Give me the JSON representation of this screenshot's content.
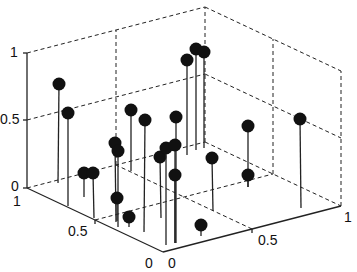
{
  "chart_data": {
    "type": "scatter",
    "subtype": "stem3",
    "title": "",
    "xlabel": "",
    "ylabel": "",
    "zlabel": "",
    "xlim": [
      0,
      1
    ],
    "ylim": [
      0,
      1
    ],
    "zlim": [
      0,
      1
    ],
    "x_ticks": [
      "0",
      "0.5",
      "1"
    ],
    "y_ticks": [
      "0",
      "0.5",
      "1"
    ],
    "z_ticks": [
      "0",
      "0.5",
      "1"
    ],
    "grid": true,
    "grid_style": "dashed",
    "marker": "filled-circle",
    "color": "#111111",
    "points_screen": [
      {
        "ball": [
          59,
          84
        ],
        "base": [
          58,
          183
        ]
      },
      {
        "ball": [
          68,
          113
        ],
        "base": [
          68,
          206
        ]
      },
      {
        "ball": [
          84,
          173
        ],
        "base": [
          84,
          197
        ]
      },
      {
        "ball": [
          93,
          173
        ],
        "base": [
          94,
          218
        ]
      },
      {
        "ball": [
          115,
          143
        ],
        "base": [
          116,
          222
        ]
      },
      {
        "ball": [
          118,
          151
        ],
        "base": [
          118,
          227
        ]
      },
      {
        "ball": [
          117,
          198
        ],
        "base": [
          117,
          221
        ]
      },
      {
        "ball": [
          129,
          217
        ],
        "base": [
          129,
          227
        ]
      },
      {
        "ball": [
          131,
          110
        ],
        "base": [
          131,
          171
        ]
      },
      {
        "ball": [
          145,
          120
        ],
        "base": [
          144,
          232
        ]
      },
      {
        "ball": [
          160,
          157
        ],
        "base": [
          161,
          218
        ]
      },
      {
        "ball": [
          166,
          148
        ],
        "base": [
          166,
          245
        ]
      },
      {
        "ball": [
          176,
          117
        ],
        "base": [
          176,
          243
        ]
      },
      {
        "ball": [
          175,
          145
        ],
        "base": [
          175,
          243
        ]
      },
      {
        "ball": [
          175,
          175
        ],
        "base": [
          175,
          243
        ]
      },
      {
        "ball": [
          187,
          60
        ],
        "base": [
          187,
          155
        ]
      },
      {
        "ball": [
          196,
          49
        ],
        "base": [
          196,
          150
        ]
      },
      {
        "ball": [
          204,
          52
        ],
        "base": [
          204,
          148
        ]
      },
      {
        "ball": [
          201,
          225
        ],
        "base": [
          201,
          236
        ]
      },
      {
        "ball": [
          212,
          158
        ],
        "base": [
          213,
          211
        ]
      },
      {
        "ball": [
          248,
          126
        ],
        "base": [
          248,
          187
        ]
      },
      {
        "ball": [
          248,
          175
        ],
        "base": [
          248,
          187
        ]
      },
      {
        "ball": [
          300,
          119
        ],
        "base": [
          301,
          208
        ]
      }
    ]
  },
  "axes": {
    "z_labels": [
      {
        "text": "1",
        "x": 10,
        "y": 57
      },
      {
        "text": "0.5",
        "x": 0,
        "y": 124
      },
      {
        "text": "0",
        "x": 11,
        "y": 191
      }
    ],
    "y_labels": [
      {
        "text": "1",
        "x": 13,
        "y": 206
      },
      {
        "text": "0.5",
        "x": 68,
        "y": 236
      },
      {
        "text": "0",
        "x": 145,
        "y": 268
      }
    ],
    "x_labels": [
      {
        "text": "0",
        "x": 168,
        "y": 268
      },
      {
        "text": "0.5",
        "x": 258,
        "y": 245
      },
      {
        "text": "1",
        "x": 344,
        "y": 222
      }
    ]
  }
}
